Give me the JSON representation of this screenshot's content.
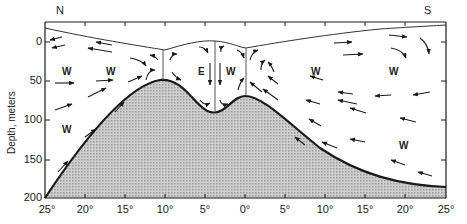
{
  "figure": {
    "type": "cross-section diagram",
    "title": "",
    "compass": {
      "left": "N",
      "right": "S"
    },
    "y_axis": {
      "label": "Depth, meters",
      "ticks": [
        "0",
        "50",
        "100",
        "150",
        "200"
      ]
    },
    "x_axis": {
      "label": "",
      "ticks": [
        "25°",
        "20°",
        "15°",
        "10°",
        "5°",
        "0°",
        "5°",
        "10°",
        "15°",
        "20°",
        "25°"
      ]
    },
    "water_mass_labels": [
      {
        "id": "w1",
        "text": "W",
        "x": 66,
        "y": 73
      },
      {
        "id": "w2",
        "text": "W",
        "x": 110,
        "y": 73
      },
      {
        "id": "w3",
        "text": "W",
        "x": 66,
        "y": 131
      },
      {
        "id": "e1",
        "text": "E",
        "x": 205,
        "y": 73
      },
      {
        "id": "w4",
        "text": "W",
        "x": 230,
        "y": 73
      },
      {
        "id": "w5",
        "text": "W",
        "x": 315,
        "y": 73
      },
      {
        "id": "w6",
        "text": "W",
        "x": 393,
        "y": 73
      },
      {
        "id": "w7",
        "text": "W",
        "x": 403,
        "y": 147
      }
    ],
    "colors": {
      "line": "#1a1a1a",
      "seafloor_fill": "#b8b8b8",
      "background": "#ffffff"
    }
  }
}
